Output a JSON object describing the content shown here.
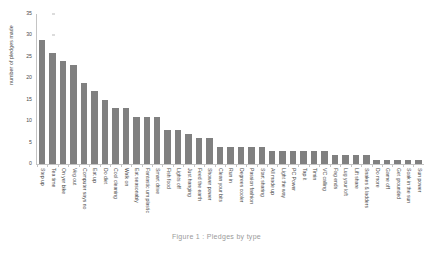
{
  "chart_data": {
    "type": "bar",
    "title": "",
    "xlabel": "",
    "ylabel": "number of pledges made",
    "ylim": [
      0,
      35
    ],
    "yticks": [
      0,
      5,
      10,
      15,
      20,
      25,
      30,
      35
    ],
    "grid": false,
    "legend": null,
    "bar_color": "#808080",
    "categories": [
      "Step up",
      "Tea time",
      "On yer bike",
      "Veg out",
      "Computer says no",
      "Eat up",
      "Do diet",
      "Cool cleaning",
      "Walk on",
      "Eat seasonably",
      "Fantastic um plastic",
      "Smart drive",
      "Fish food",
      "Lights off",
      "Just hanging",
      "Feed the earth",
      "Shower power",
      "Clean your bits",
      "Run in",
      "Degrees cooler",
      "Passion fashion",
      "Start sharing",
      "All made up",
      "Light the way",
      "PC Power",
      "Tap it",
      "Timin",
      "VC calling",
      "Fag ends",
      "Lug your loft",
      "Lift share",
      "Snakes & ladders",
      "Do more",
      "Game off",
      "Get grounded",
      "Soak in the sun",
      "Sun power"
    ],
    "values": [
      29,
      26,
      24,
      23,
      19,
      17,
      15,
      13,
      13,
      11,
      11,
      11,
      8,
      8,
      7,
      6,
      6,
      4,
      4,
      4,
      4,
      4,
      3,
      3,
      3,
      3,
      3,
      3,
      2,
      2,
      2,
      2,
      1,
      1,
      1,
      1,
      1
    ]
  },
  "caption": {
    "text": "Figure 1 : Pledges by type"
  }
}
